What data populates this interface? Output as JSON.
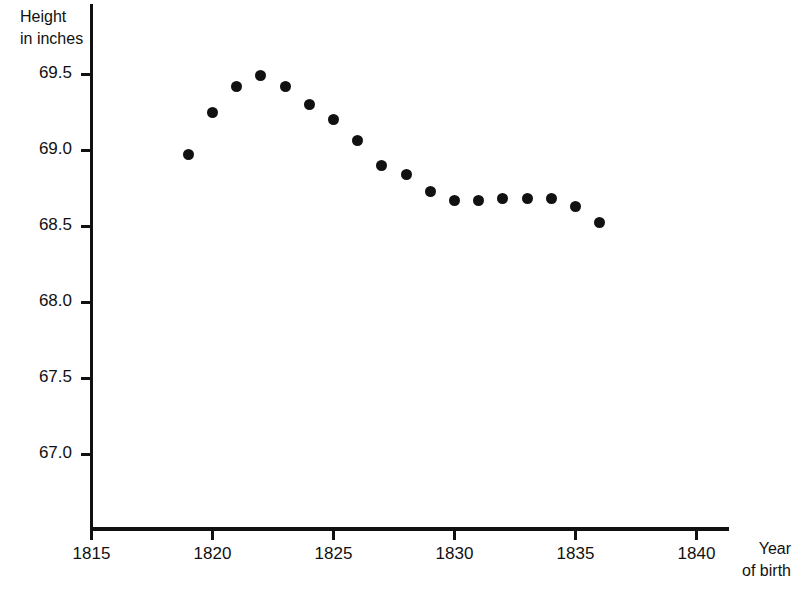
{
  "chart_data": {
    "type": "scatter",
    "title": "",
    "xlabel": "Year of birth",
    "ylabel": "Height in inches",
    "xlabel_lines": [
      "Year",
      "of birth"
    ],
    "ylabel_lines": [
      "Height",
      "in inches"
    ],
    "xlim": [
      1813.8,
      1840.2
    ],
    "ylim": [
      66.55,
      69.72
    ],
    "grid": false,
    "legend": null,
    "xticks": [
      1815,
      1820,
      1825,
      1830,
      1835,
      1840
    ],
    "xtick_labels": [
      "1815",
      "1820",
      "1825",
      "1830",
      "1835",
      "1840"
    ],
    "yticks": [
      67.0,
      67.5,
      68.0,
      68.5,
      69.0,
      69.5
    ],
    "ytick_labels": [
      "67.0",
      "67.5",
      "68.0",
      "68.5",
      "69.0",
      "69.5"
    ],
    "x": [
      1819,
      1820,
      1821,
      1822,
      1823,
      1824,
      1825,
      1826,
      1827,
      1828,
      1829,
      1830,
      1831,
      1832,
      1833,
      1834,
      1835,
      1836
    ],
    "y": [
      68.97,
      69.25,
      69.42,
      69.49,
      69.42,
      69.3,
      69.2,
      69.06,
      68.9,
      68.84,
      68.73,
      68.67,
      68.67,
      68.68,
      68.68,
      68.68,
      68.63,
      68.52
    ],
    "marker": "filled-circle",
    "marker_color": "#111111",
    "background_color": "#ffffff"
  },
  "axes": {
    "y_title_line1": "Height",
    "y_title_line2": "in inches",
    "x_title_line1": "Year",
    "x_title_line2": "of birth"
  }
}
